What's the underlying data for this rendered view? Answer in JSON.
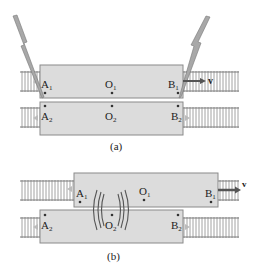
{
  "figure_a": {
    "caption": "(a)",
    "car1": {
      "point_A": "A",
      "sub_A": "1",
      "point_O": "O",
      "sub_O": "1",
      "point_B": "B",
      "sub_B": "1"
    },
    "car2": {
      "point_A": "A",
      "sub_A": "2",
      "point_O": "O",
      "sub_O": "2",
      "point_B": "B",
      "sub_B": "2"
    },
    "velocity_label": "v"
  },
  "figure_b": {
    "caption": "(b)",
    "car1": {
      "point_A": "A",
      "sub_A": "1",
      "point_O": "O",
      "sub_O": "1",
      "point_B": "B",
      "sub_B": "1"
    },
    "car2": {
      "point_A": "A",
      "sub_A": "2",
      "point_O": "O",
      "sub_O": "2",
      "point_B": "B",
      "sub_B": "2"
    },
    "velocity_label": "v"
  },
  "colors": {
    "car_fill": "#dcdcdc",
    "car_stroke": "#8a8a8a",
    "track": "#7a7a7a",
    "bolt_fill": "#a8a8a8",
    "arrow": "#555555",
    "text": "#222222"
  }
}
